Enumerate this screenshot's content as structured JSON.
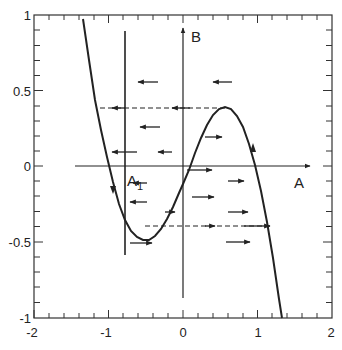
{
  "diagram": {
    "type": "phase_plane",
    "axis_labels": {
      "x": "A",
      "y": "B"
    },
    "point_label": "A",
    "point_label_sub": "1",
    "x_ticks": [
      "-2",
      "-1",
      "0",
      "1",
      "2"
    ],
    "y_ticks": [
      "1",
      "0.5",
      "0",
      "-0.5",
      "-1"
    ],
    "xlim": [
      -2,
      2
    ],
    "ylim": [
      -1,
      1
    ],
    "nullcline": "B = A - A^3",
    "vertical_line_A": -0.77,
    "dashed_levels": [
      0.385,
      -0.385
    ],
    "colors": {
      "ink": "#222222",
      "background": "#ffffff"
    }
  }
}
